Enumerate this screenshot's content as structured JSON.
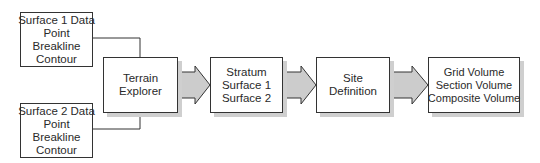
{
  "diagram": {
    "nodes": [
      {
        "id": "surface1",
        "lines": [
          "Surface 1 Data",
          "Point",
          "Breakline",
          "Contour"
        ]
      },
      {
        "id": "surface2",
        "lines": [
          "Surface 2 Data",
          "Point",
          "Breakline",
          "Contour"
        ]
      },
      {
        "id": "terrain",
        "lines": [
          "Terrain",
          "Explorer"
        ]
      },
      {
        "id": "stratum",
        "lines": [
          "Stratum",
          "Surface 1",
          "Surface 2"
        ]
      },
      {
        "id": "site",
        "lines": [
          "Site",
          "Definition"
        ]
      },
      {
        "id": "volume",
        "lines": [
          "Grid Volume",
          "Section Volume",
          "Composite Volume"
        ]
      }
    ],
    "edges": [
      {
        "from": "surface1",
        "to": "terrain",
        "style": "line"
      },
      {
        "from": "surface2",
        "to": "terrain",
        "style": "line"
      },
      {
        "from": "terrain",
        "to": "stratum",
        "style": "block-arrow"
      },
      {
        "from": "stratum",
        "to": "site",
        "style": "block-arrow"
      },
      {
        "from": "site",
        "to": "volume",
        "style": "block-arrow"
      }
    ],
    "colors": {
      "border": "#333333",
      "arrow_fill": "#cccccc",
      "shadow": "#cfcfcf"
    }
  }
}
